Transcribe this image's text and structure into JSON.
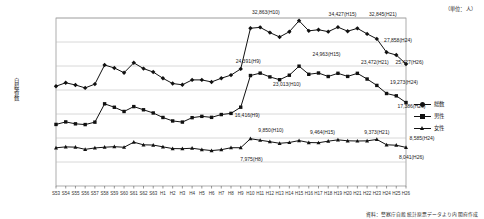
{
  "unit_note": "（単位：人）",
  "source_note": "資料：警察庁自殺統計原票データより内閣府作成",
  "yaxis": {
    "label": "自殺者数",
    "ticks": [
      "35,000",
      "30,000",
      "25,000",
      "20,000",
      "15,000",
      "10,000",
      "5,000",
      "0"
    ],
    "min": 0,
    "max": 35000
  },
  "legend": {
    "position": "right",
    "items": [
      {
        "label": "総数",
        "marker": "diamond"
      },
      {
        "label": "男性",
        "marker": "square"
      },
      {
        "label": "女性",
        "marker": "triangle"
      }
    ]
  },
  "annotations": [
    {
      "text": "32,863(H10)",
      "x": 22,
      "y": 32863,
      "dx": -4,
      "dy": -16
    },
    {
      "text": "34,427(H15)",
      "x": 27,
      "y": 34427,
      "dx": 24,
      "dy": -7
    },
    {
      "text": "32,845(H21)",
      "x": 33,
      "y": 32845,
      "dx": 6,
      "dy": -14
    },
    {
      "text": "27,858(H24)",
      "x": 36,
      "y": 27858,
      "dx": -8,
      "dy": -12
    },
    {
      "text": "25,427(H26)",
      "x": 38,
      "y": 25427,
      "dx": -16,
      "dy": -2
    },
    {
      "text": "24,391(H9)",
      "x": 21,
      "y": 24391,
      "dx": -12,
      "dy": -8
    },
    {
      "text": "23,013(H10)",
      "x": 22,
      "y": 23013,
      "dx": 17,
      "dy": 8
    },
    {
      "text": "24,963(H15)",
      "x": 27,
      "y": 24963,
      "dx": 8,
      "dy": -12
    },
    {
      "text": "23,472(H21)",
      "x": 33,
      "y": 23472,
      "dx": -2,
      "dy": -11
    },
    {
      "text": "19,273(H24)",
      "x": 36,
      "y": 19273,
      "dx": -2,
      "dy": -11
    },
    {
      "text": "17,386(H26)",
      "x": 38,
      "y": 17386,
      "dx": -14,
      "dy": 3
    },
    {
      "text": "16,416(H9)",
      "x": 21,
      "y": 16416,
      "dx": -13,
      "dy": 8
    },
    {
      "text": "7,975(H8)",
      "x": 20,
      "y": 7975,
      "dx": 1,
      "dy": 11
    },
    {
      "text": "9,850(H10)",
      "x": 22,
      "y": 9850,
      "dx": 1,
      "dy": -9
    },
    {
      "text": "9,464(H15)",
      "x": 27,
      "y": 9464,
      "dx": 4,
      "dy": -9
    },
    {
      "text": "9,373(H21)",
      "x": 33,
      "y": 9373,
      "dx": 0,
      "dy": -9
    },
    {
      "text": "8,585(H24)",
      "x": 36,
      "y": 8585,
      "dx": 16,
      "dy": -7
    },
    {
      "text": "8,041(H26)",
      "x": 38,
      "y": 8041,
      "dx": -14,
      "dy": 10
    }
  ],
  "chart_data": {
    "type": "line",
    "title": "",
    "xlabel": "",
    "ylabel": "自殺者数",
    "ylim": [
      0,
      35000
    ],
    "grid": true,
    "legend_position": "right",
    "categories": [
      "S53",
      "S54",
      "S55",
      "S56",
      "S57",
      "S58",
      "S59",
      "S60",
      "S61",
      "S62",
      "S63",
      "H1",
      "H2",
      "H3",
      "H4",
      "H5",
      "H6",
      "H7",
      "H8",
      "H9",
      "H10",
      "H11",
      "H12",
      "H13",
      "H14",
      "H15",
      "H16",
      "H17",
      "H18",
      "H19",
      "H20",
      "H21",
      "H22",
      "H23",
      "H24",
      "H25",
      "H26"
    ],
    "series": [
      {
        "name": "総数",
        "marker": "diamond",
        "values": [
          20788,
          21503,
          21048,
          20434,
          21228,
          25202,
          24596,
          23599,
          25667,
          24460,
          23742,
          22436,
          21346,
          21084,
          22104,
          22104,
          21679,
          22445,
          23104,
          24391,
          32863,
          33048,
          31957,
          31042,
          32143,
          34427,
          32325,
          32552,
          32155,
          33093,
          32249,
          32845,
          31690,
          30651,
          27858,
          27283,
          25427
        ]
      },
      {
        "name": "男性",
        "marker": "square",
        "values": [
          12827,
          13352,
          12954,
          12798,
          13300,
          17120,
          16403,
          15528,
          16541,
          15881,
          15213,
          14276,
          13553,
          13317,
          14234,
          14511,
          14298,
          14884,
          15129,
          16416,
          23013,
          23512,
          22727,
          22144,
          23080,
          24963,
          23272,
          23540,
          22813,
          23478,
          22831,
          23472,
          22283,
          20955,
          19273,
          18787,
          17386
        ]
      },
      {
        "name": "女性",
        "marker": "triangle",
        "values": [
          7961,
          8151,
          8094,
          7636,
          7928,
          8082,
          8193,
          8071,
          9126,
          8579,
          8529,
          8160,
          7793,
          7767,
          7870,
          7593,
          7381,
          7561,
          7975,
          7975,
          9850,
          9536,
          9230,
          8898,
          9063,
          9464,
          9053,
          9012,
          9342,
          9615,
          9418,
          9373,
          9407,
          9696,
          8585,
          8496,
          8041
        ]
      }
    ]
  }
}
